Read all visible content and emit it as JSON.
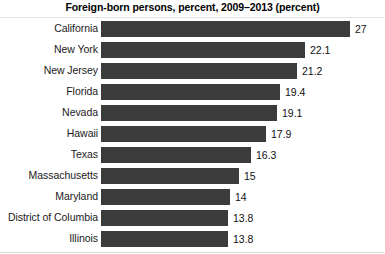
{
  "chart_data": {
    "type": "bar",
    "orientation": "horizontal",
    "title": "Foreign-born persons, percent, 2009–2013 (percent)",
    "xlabel": "",
    "ylabel": "",
    "categories": [
      "California",
      "New York",
      "New Jersey",
      "Florida",
      "Nevada",
      "Hawaii",
      "Texas",
      "Massachusetts",
      "Maryland",
      "District of Columbia",
      "Illinois"
    ],
    "values": [
      27,
      22.1,
      21.2,
      19.4,
      19.1,
      17.9,
      16.3,
      15,
      14,
      13.8,
      13.8
    ],
    "value_labels": [
      "27",
      "22.1",
      "21.2",
      "19.4",
      "19.1",
      "17.9",
      "16.3",
      "15",
      "14",
      "13.8",
      "13.8"
    ],
    "xlim": [
      0,
      27
    ],
    "grid": false,
    "legend": null,
    "bar_color": "#3b3b3b",
    "background_color": "#ffffff",
    "text_color": "#111111"
  }
}
